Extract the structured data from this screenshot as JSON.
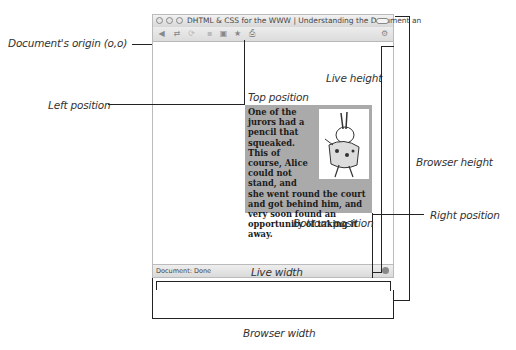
{
  "diagram": {
    "labels": {
      "origin": "Document's origin (o,o)",
      "left_position": "Left position",
      "top_position": "Top position",
      "live_height": "Live height",
      "browser_height": "Browser height",
      "right_position": "Right position",
      "bottom_position": "Bottom position",
      "live_width": "Live width",
      "browser_width": "Browser width"
    }
  },
  "browser": {
    "title": "DHTML & CSS for the WWW | Understanding the Document an",
    "toolbar_icons": [
      "back-icon",
      "forward-icon",
      "reload-icon",
      "stop-icon",
      "home-icon",
      "bookmark-icon",
      "print-icon"
    ],
    "status": "Document: Done"
  },
  "element": {
    "text": "One of the jurors had a pencil that squeaked. This of course, Alice could not stand, and she went round the court and got behind him, and very soon found an opportunity of taking it away.",
    "image": "white-rabbit-illustration"
  }
}
